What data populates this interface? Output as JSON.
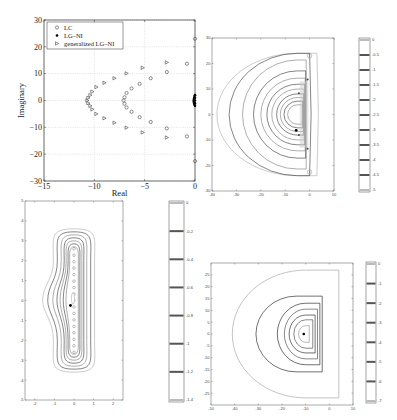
{
  "chart_data": [
    {
      "type": "scatter",
      "title": "",
      "xlabel": "Real",
      "ylabel": "Imaginary",
      "xlim": [
        -15,
        0
      ],
      "ylim": [
        -30,
        30
      ],
      "xticks": [
        "-15",
        "-10",
        "-5",
        "0"
      ],
      "yticks": [
        "30",
        "20",
        "10",
        "0",
        "-10",
        "-20",
        "-30"
      ],
      "grid": true,
      "legend": {
        "position": "upper-left",
        "entries": [
          "LC",
          "LG–NI",
          "generalized LG–NI"
        ]
      },
      "series": [
        {
          "name": "LC",
          "marker": "circle",
          "points": [
            [
              0,
              23
            ],
            [
              -0.8,
              13.7
            ],
            [
              -2.8,
              10.6
            ],
            [
              -4.4,
              8.3
            ],
            [
              -5.5,
              6.2
            ],
            [
              -6.3,
              4.5
            ],
            [
              -6.8,
              2.8
            ],
            [
              -7,
              1.2
            ],
            [
              -7.1,
              0
            ],
            [
              -7,
              -1.2
            ],
            [
              -6.8,
              -2.6
            ],
            [
              -6.3,
              -4.2
            ],
            [
              -5.5,
              -6.2
            ],
            [
              -4.4,
              -8
            ],
            [
              -2.8,
              -10.4
            ],
            [
              -0.8,
              -13.4
            ],
            [
              0,
              -22.6
            ]
          ]
        },
        {
          "name": "LG–NI",
          "marker": "filled-circle",
          "points": [
            [
              0,
              2
            ],
            [
              0,
              1
            ],
            [
              0,
              0
            ],
            [
              0,
              -1
            ],
            [
              0,
              -2
            ]
          ]
        },
        {
          "name": "generalized LG–NI",
          "marker": "triangle-right",
          "points": [
            [
              -2.8,
              14.2
            ],
            [
              -5.2,
              12.2
            ],
            [
              -6.8,
              10.1
            ],
            [
              -8,
              8.3
            ],
            [
              -9,
              6.6
            ],
            [
              -9.8,
              5
            ],
            [
              -10.2,
              3.3
            ],
            [
              -10.4,
              2
            ],
            [
              -10.6,
              1
            ],
            [
              -10.7,
              0
            ],
            [
              -10.6,
              -1
            ],
            [
              -10.4,
              -2
            ],
            [
              -10.2,
              -3.3
            ],
            [
              -9.8,
              -5
            ],
            [
              -9,
              -6.6
            ],
            [
              -8,
              -8.3
            ],
            [
              -6.8,
              -10.1
            ],
            [
              -5.2,
              -11.9
            ],
            [
              -2.8,
              -13.8
            ]
          ]
        }
      ]
    },
    {
      "type": "contour",
      "title": "",
      "xlabel": "",
      "ylabel": "",
      "xlim": [
        -40,
        10
      ],
      "ylim": [
        -30,
        30
      ],
      "xticks": [
        "-40",
        "-30",
        "-20",
        "-10",
        "0",
        "10"
      ],
      "yticks": [
        "30",
        "20",
        "10",
        "0",
        "-10",
        "-20",
        "-30"
      ],
      "colorbar": {
        "range": [
          -5,
          0
        ],
        "ticks": [
          "0",
          "-0.5",
          "-1",
          "-1.5",
          "-2",
          "-2.5",
          "-3",
          "-3.5",
          "-4",
          "-4.5",
          "-5"
        ]
      }
    },
    {
      "type": "contour",
      "title": "",
      "xlabel": "",
      "ylabel": "",
      "xlim": [
        -2.5,
        2.5
      ],
      "ylim": [
        -5,
        5
      ],
      "xticks": [
        "-2",
        "-1",
        "0",
        "1",
        "2"
      ],
      "yticks": [
        "5",
        "4",
        "3",
        "2",
        "1",
        "0",
        "-1",
        "-2",
        "-3",
        "-4",
        "-5"
      ],
      "colorbar": {
        "range": [
          -1.4,
          0
        ],
        "ticks": [
          "0",
          "-0.2",
          "-0.4",
          "-0.6",
          "-0.8",
          "-1",
          "-1.2",
          "-1.4"
        ]
      }
    },
    {
      "type": "contour",
      "title": "",
      "xlabel": "",
      "ylabel": "",
      "xlim": [
        -50,
        10
      ],
      "ylim": [
        -30,
        30
      ],
      "xticks": [
        "-50",
        "-40",
        "-30",
        "-20",
        "-10",
        "0",
        "10"
      ],
      "yticks": [
        "25",
        "20",
        "15",
        "10",
        "5",
        "0",
        "-5",
        "-10",
        "-15",
        "-20",
        "-25"
      ],
      "colorbar": {
        "range": [
          -7,
          0
        ],
        "ticks": [
          "0",
          "-1",
          "-2",
          "-3",
          "-4",
          "-5",
          "-6",
          "-7"
        ]
      }
    }
  ]
}
